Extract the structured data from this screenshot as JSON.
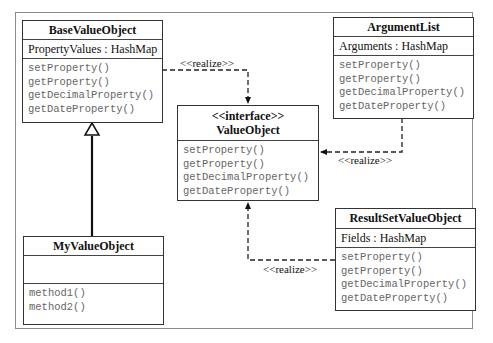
{
  "diagram": {
    "type": "UML class diagram",
    "classes": {
      "base_value_object": {
        "name": "BaseValueObject",
        "attributes": [
          "PropertyValues : HashMap"
        ],
        "methods": [
          "setProperty()",
          "getProperty()",
          "getDecimalProperty()",
          "getDateProperty()"
        ]
      },
      "value_object": {
        "stereotype": "<<interface>>",
        "name": "ValueObject",
        "methods": [
          "setProperty()",
          "getProperty()",
          "getDecimalProperty()",
          "getDateProperty()"
        ]
      },
      "argument_list": {
        "name": "ArgumentList",
        "attributes": [
          "Arguments : HashMap"
        ],
        "methods": [
          "setProperty()",
          "getProperty()",
          "getDecimalProperty()",
          "getDateProperty()"
        ]
      },
      "my_value_object": {
        "name": "MyValueObject",
        "attributes": [],
        "methods": [
          "method1()",
          "method2()"
        ]
      },
      "result_set_value_object": {
        "name": "ResultSetValueObject",
        "attributes": [
          "Fields : HashMap"
        ],
        "methods": [
          "setProperty()",
          "getProperty()",
          "getDecimalProperty()",
          "getDateProperty()"
        ]
      }
    },
    "relationships": [
      {
        "from": "BaseValueObject",
        "to": "ValueObject",
        "kind": "realization",
        "label": "<<realize>>"
      },
      {
        "from": "ArgumentList",
        "to": "ValueObject",
        "kind": "realization",
        "label": "<<realize>>"
      },
      {
        "from": "ResultSetValueObject",
        "to": "ValueObject",
        "kind": "realization",
        "label": "<<realize>>"
      },
      {
        "from": "MyValueObject",
        "to": "BaseValueObject",
        "kind": "generalization",
        "label": ""
      }
    ],
    "labels": {
      "realize_1": "<<realize>>",
      "realize_2": "<<realize>>",
      "realize_3": "<<realize>>"
    }
  }
}
